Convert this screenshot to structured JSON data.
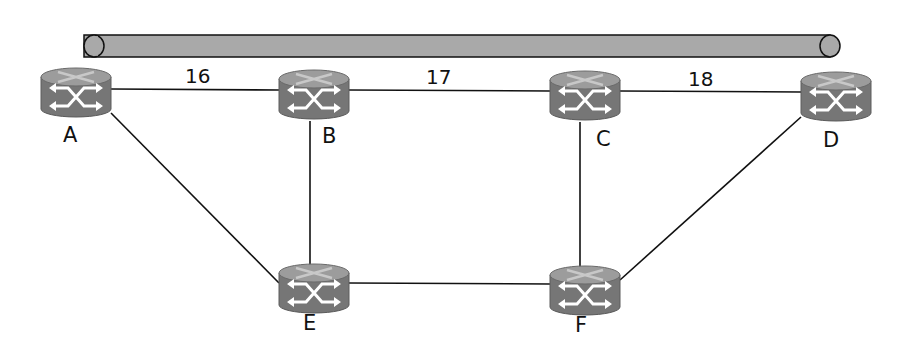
{
  "diagram": {
    "type": "network-topology",
    "pipe": {
      "label": "",
      "x1": 84,
      "x2": 830,
      "y": 46,
      "r": 11
    },
    "nodes": [
      {
        "id": "A",
        "label": "A",
        "x": 76,
        "y": 95
      },
      {
        "id": "B",
        "label": "B",
        "x": 314,
        "y": 97
      },
      {
        "id": "C",
        "label": "C",
        "x": 585,
        "y": 98
      },
      {
        "id": "D",
        "label": "D",
        "x": 836,
        "y": 99
      },
      {
        "id": "E",
        "label": "E",
        "x": 314,
        "y": 291
      },
      {
        "id": "F",
        "label": "F",
        "x": 585,
        "y": 293
      }
    ],
    "edges": [
      {
        "from": "A",
        "to": "B",
        "weight": "16"
      },
      {
        "from": "B",
        "to": "C",
        "weight": "17"
      },
      {
        "from": "C",
        "to": "D",
        "weight": "18"
      },
      {
        "from": "A",
        "to": "E",
        "weight": ""
      },
      {
        "from": "B",
        "to": "E",
        "weight": ""
      },
      {
        "from": "C",
        "to": "F",
        "weight": ""
      },
      {
        "from": "D",
        "to": "F",
        "weight": ""
      },
      {
        "from": "E",
        "to": "F",
        "weight": ""
      }
    ],
    "colors": {
      "router_body": "#7a7a7a",
      "router_top": "#9a9a9a",
      "pipe": "#a9a9a9",
      "line": "#111111"
    }
  }
}
